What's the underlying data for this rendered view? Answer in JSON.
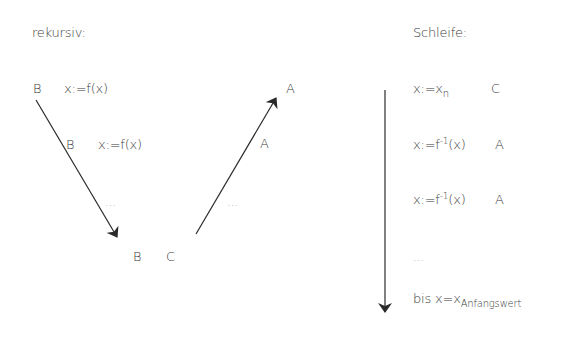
{
  "recursive": {
    "heading": "rekursiv:",
    "step1": {
      "label": "B",
      "expr": "x:=f(x)"
    },
    "step2": {
      "label": "B",
      "expr": "x:=f(x)"
    },
    "down_ellipsis": "…",
    "bottom_left": "B",
    "bottom_right": "C",
    "up_ellipsis": "…",
    "up_mid_label": "A",
    "up_top_label": "A"
  },
  "loop": {
    "heading": "Schleife:",
    "rows": [
      {
        "expr_base": "x:=x",
        "expr_sub": "n",
        "label": "C"
      },
      {
        "expr_base": "x:=f",
        "expr_sup": "-1",
        "expr_tail": "(x)",
        "label": "A"
      },
      {
        "expr_base": "x:=f",
        "expr_sup": "-1",
        "expr_tail": "(x)",
        "label": "A"
      }
    ],
    "ellipsis": "…",
    "end_base": "bis x=x",
    "end_sub": "Anfangswert"
  },
  "colors": {
    "text": "#3a3a3a",
    "arrow": "#2a2a2a"
  }
}
